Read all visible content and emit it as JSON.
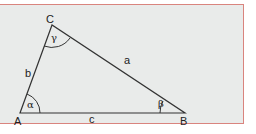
{
  "diagram": {
    "type": "triangle",
    "colors": {
      "frame_border": "#d9847e",
      "frame_fill": "#e9ebea",
      "line": "#333333"
    },
    "vertices": [
      {
        "id": "A",
        "label": "A",
        "x": 20,
        "y": 113
      },
      {
        "id": "B",
        "label": "B",
        "x": 185,
        "y": 113
      },
      {
        "id": "C",
        "label": "C",
        "x": 52,
        "y": 25
      }
    ],
    "sides": [
      {
        "id": "a",
        "label": "a",
        "between": [
          "B",
          "C"
        ]
      },
      {
        "id": "b",
        "label": "b",
        "between": [
          "A",
          "C"
        ]
      },
      {
        "id": "c",
        "label": "c",
        "between": [
          "A",
          "B"
        ]
      }
    ],
    "angles": [
      {
        "id": "alpha",
        "label": "α",
        "at": "A"
      },
      {
        "id": "beta",
        "label": "β",
        "at": "B"
      },
      {
        "id": "gamma",
        "label": "γ",
        "at": "C"
      }
    ]
  }
}
